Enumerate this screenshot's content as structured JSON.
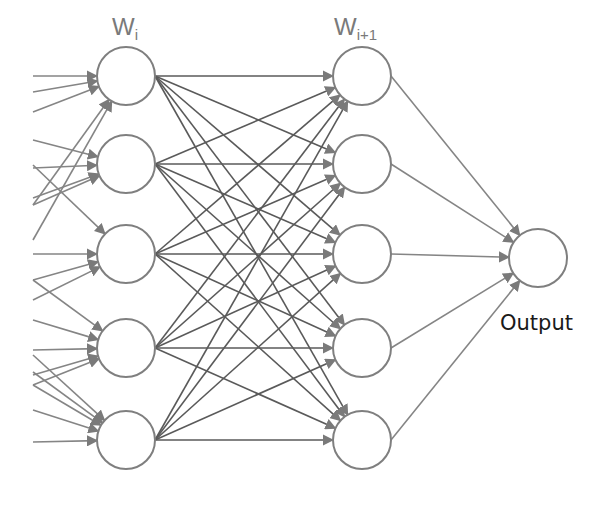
{
  "diagram": {
    "type": "feedforward-neural-network",
    "labels": {
      "layer_i": {
        "base": "W",
        "subscript": "i"
      },
      "layer_i_plus_1": {
        "base": "W",
        "subscript": "i+1"
      },
      "output": "Output"
    },
    "colors": {
      "edge": "#858585",
      "edge_dense": "#5a5a5a",
      "node_stroke": "#7f7f7f",
      "node_fill": "#ffffff",
      "background": "#ffffff"
    },
    "node_radius": 29,
    "layers": [
      {
        "name": "layer-i",
        "x": 126,
        "ys": [
          76,
          164,
          254,
          348,
          440
        ]
      },
      {
        "name": "layer-i-plus-1",
        "x": 362,
        "ys": [
          76,
          164,
          254,
          348,
          440
        ]
      },
      {
        "name": "output",
        "x": 538,
        "ys": [
          258
        ]
      }
    ],
    "input_edges": [
      {
        "from_y": 76,
        "to": 0
      },
      {
        "from_y": 92,
        "to": 0
      },
      {
        "from_y": 112,
        "to": 0
      },
      {
        "from_y": 205,
        "to": 0
      },
      {
        "from_y": 240,
        "to": 0
      },
      {
        "from_y": 140,
        "to": 1
      },
      {
        "from_y": 168,
        "to": 1
      },
      {
        "from_y": 198,
        "to": 1
      },
      {
        "from_y": 205,
        "to": 1
      },
      {
        "from_y": 165,
        "to": 2
      },
      {
        "from_y": 254,
        "to": 2
      },
      {
        "from_y": 280,
        "to": 2
      },
      {
        "from_y": 300,
        "to": 2
      },
      {
        "from_y": 280,
        "to": 3
      },
      {
        "from_y": 320,
        "to": 3
      },
      {
        "from_y": 350,
        "to": 3
      },
      {
        "from_y": 375,
        "to": 3
      },
      {
        "from_y": 385,
        "to": 3
      },
      {
        "from_y": 355,
        "to": 4
      },
      {
        "from_y": 372,
        "to": 4
      },
      {
        "from_y": 385,
        "to": 4
      },
      {
        "from_y": 410,
        "to": 4
      },
      {
        "from_y": 442,
        "to": 4
      }
    ],
    "input_edge_start_x": 33
  }
}
